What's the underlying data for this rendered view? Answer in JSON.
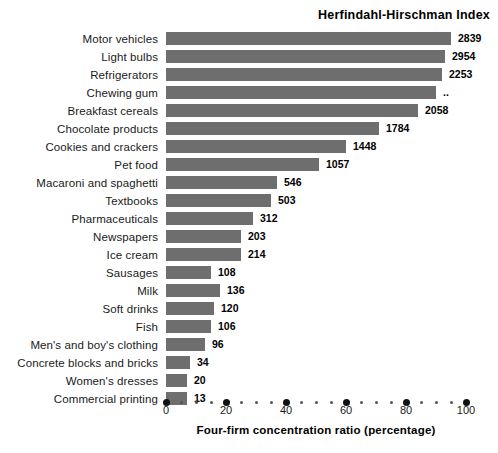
{
  "chart_data": {
    "type": "bar",
    "orientation": "horizontal",
    "title": "Herfindahl-Hirschman Index",
    "xlabel": "Four-firm concentration ratio (percentage)",
    "ylabel": "",
    "xlim": [
      0,
      100
    ],
    "grid": false,
    "legend": null,
    "xticks": [
      "0",
      "20",
      "40",
      "60",
      "80",
      "100"
    ],
    "xtick_values": [
      0,
      20,
      40,
      60,
      80,
      100
    ],
    "minor_tick_step": 5,
    "bar_color": "#6e6e6e",
    "categories": [
      "Motor vehicles",
      "Light bulbs",
      "Refrigerators",
      "Chewing gum",
      "Breakfast cereals",
      "Chocolate products",
      "Cookies and crackers",
      "Pet food",
      "Macaroni and spaghetti",
      "Textbooks",
      "Pharmaceuticals",
      "Newspapers",
      "Ice cream",
      "Sausages",
      "Milk",
      "Soft drinks",
      "Fish",
      "Men's and boy's clothing",
      "Concrete blocks and bricks",
      "Women's dresses",
      "Commercial printing"
    ],
    "values": [
      95,
      93,
      92,
      90,
      84,
      71,
      60,
      51,
      37,
      35,
      29,
      25,
      25,
      15,
      18,
      16,
      15,
      13,
      8,
      7,
      7
    ],
    "value_labels": [
      "2839",
      "2954",
      "2253",
      "..",
      "2058",
      "1784",
      "1448",
      "1057",
      "546",
      "503",
      "312",
      "203",
      "214",
      "108",
      "136",
      "120",
      "106",
      "96",
      "34",
      "20",
      "13"
    ],
    "series": [
      {
        "name": "Four-firm concentration ratio (percentage)",
        "values": [
          95,
          93,
          92,
          90,
          84,
          71,
          60,
          51,
          37,
          35,
          29,
          25,
          25,
          15,
          18,
          16,
          15,
          13,
          8,
          7,
          7
        ]
      },
      {
        "name": "Herfindahl-Hirschman Index",
        "values": [
          2839,
          2954,
          2253,
          null,
          2058,
          1784,
          1448,
          1057,
          546,
          503,
          312,
          203,
          214,
          108,
          136,
          120,
          106,
          96,
          34,
          20,
          13
        ]
      }
    ]
  }
}
